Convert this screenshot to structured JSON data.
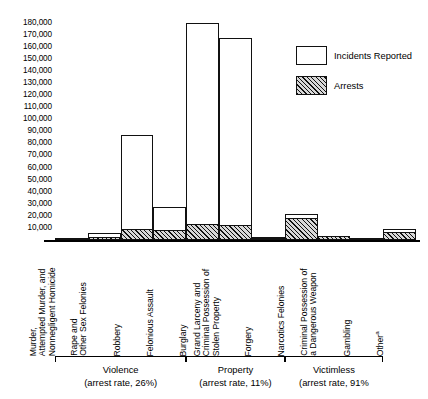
{
  "chart_data": {
    "type": "bar",
    "title": "",
    "xlabel": "",
    "ylabel": "",
    "ylim": [
      0,
      185000
    ],
    "grid": false,
    "legend_position": "upper-right",
    "y_ticks": [
      "180,000",
      "170,000",
      "160,000",
      "150,000",
      "140,000",
      "130,000",
      "120,000",
      "110,000",
      "100,000",
      "90,000",
      "80,000",
      "70,000",
      "60,000",
      "50,000",
      "40,000",
      "30,000",
      "20,000",
      "10,000"
    ],
    "y_tick_values": [
      180000,
      170000,
      160000,
      150000,
      140000,
      130000,
      120000,
      110000,
      100000,
      90000,
      80000,
      70000,
      60000,
      50000,
      40000,
      30000,
      20000,
      10000
    ],
    "categories": [
      "Murder, Attempted Murder, and Nonnegligent Homicide",
      "Rape and Other Sex Felonies",
      "Robbery",
      "Felonious Assault",
      "Burglary",
      "Grand Larceny and Criminal Possession of Stolen Property",
      "Forgery",
      "Narcotics Felonies",
      "Criminal Possession of a Dangerous Weapon",
      "Gambling",
      "Other"
    ],
    "category_lines": [
      [
        "Murder,",
        "Attempted Murder, and",
        "Nonnegligent Homicide"
      ],
      [
        "Rape and",
        "Other Sex Felonies"
      ],
      [
        "Robbery"
      ],
      [
        "Felonious Assault"
      ],
      [
        "Burglary"
      ],
      [
        "Grand Larceny and",
        "Criminal Possession of",
        "Stolen Property"
      ],
      [
        "Forgery"
      ],
      [
        "Narcotics Felonies"
      ],
      [
        "Criminal Possession of",
        "a Dangerous Weapon"
      ],
      [
        "Gambling"
      ],
      [
        "Other"
      ]
    ],
    "series": [
      {
        "name": "Incidents Reported",
        "values": [
          2000,
          6000,
          87500,
          27000,
          180000,
          168000,
          2500,
          22000,
          3500,
          2000,
          9000
        ]
      },
      {
        "name": "Arrests",
        "values": [
          1500,
          2500,
          9000,
          8500,
          13500,
          12500,
          1800,
          18500,
          3000,
          1800,
          6500
        ]
      }
    ],
    "groups": [
      {
        "label": "Violence",
        "rate_text": "(arrest rate, 26%)",
        "arrest_rate": 26,
        "categories": [
          0,
          1,
          2,
          3
        ]
      },
      {
        "label": "Property",
        "rate_text": "(arrest rate, 11%)",
        "arrest_rate": 11,
        "categories": [
          4,
          5,
          6
        ]
      },
      {
        "label": "Victimless",
        "rate_text": "(arrest rate, 91%",
        "arrest_rate": 91,
        "categories": [
          7,
          8,
          9
        ]
      }
    ],
    "footnote_marker": "a"
  },
  "legend": {
    "items": [
      {
        "label": "Incidents Reported",
        "style": "outline"
      },
      {
        "label": "Arrests",
        "style": "hatched"
      }
    ]
  },
  "colors": {
    "ink": "#111111",
    "background": "#ffffff",
    "hatch_fill": "#d8d8d8"
  }
}
